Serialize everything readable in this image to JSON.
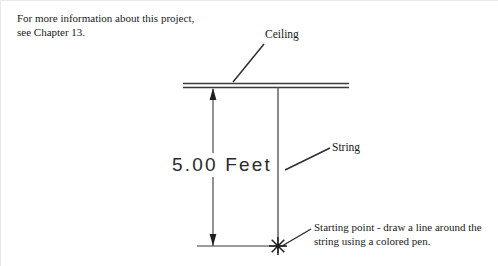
{
  "diagram": {
    "notes": {
      "intro": "For more information about this project, see Chapter 13.",
      "starting_point": "Starting point - draw a line around the string using a colored pen."
    },
    "labels": {
      "ceiling": "Ceiling",
      "string": "String"
    },
    "dimension": {
      "value": "5.00",
      "unit": "Feet",
      "text": "5.00 Feet"
    },
    "colors": {
      "background": "#ffffff",
      "line": "#3a3a3a",
      "text": "#1a1a1a",
      "dimension_text": "#2a2a2a",
      "border": "#e8e8e8"
    },
    "geometry": {
      "ceiling_line_1_y": 82,
      "ceiling_line_2_y": 86,
      "ceiling_x_start": 182,
      "ceiling_x_end": 348,
      "string_x": 277,
      "string_y_top": 86,
      "string_y_bottom": 252,
      "dimension_x": 212,
      "dimension_y_top": 86,
      "dimension_y_bottom": 245,
      "bottom_extension_x_start": 196,
      "bottom_extension_x_end": 285,
      "bottom_extension_y": 245,
      "star_cx": 277,
      "star_cy": 245
    }
  }
}
